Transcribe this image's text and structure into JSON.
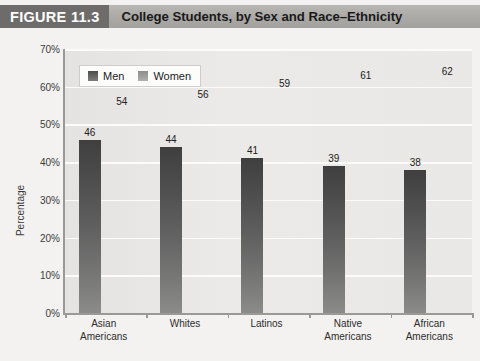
{
  "figure": {
    "number_label": "FIGURE 11.3",
    "title": "College Students, by Sex and Race–Ethnicity"
  },
  "legend": {
    "position": "top-left-inside",
    "entries": [
      {
        "label": "Men",
        "swatch": "men-swatch",
        "color": "#5e5e5e"
      },
      {
        "label": "Women",
        "swatch": "women-swatch",
        "color": "#9a9a97"
      }
    ]
  },
  "axes": {
    "ylabel": "Percentage",
    "yticks": [
      "0%",
      "10%",
      "20%",
      "30%",
      "40%",
      "50%",
      "60%",
      "70%"
    ],
    "ymin": 0,
    "ymax": 70,
    "ystep": 10,
    "xlabel": ""
  },
  "colors": {
    "title_block": "#6e6c6a",
    "title_band": "#aba9a6",
    "page_background": "#f3f2f0",
    "plot_background": "#e8e7e5",
    "gridline": "#fbfbfa",
    "axis_line": "#9b9996",
    "men_bar": "#5e5e5e",
    "women_bar": "#9a9a97"
  },
  "chart_data": {
    "type": "bar",
    "title": "College Students, by Sex and Race–Ethnicity",
    "xlabel": "",
    "ylabel": "Percentage",
    "ylim": [
      0,
      70
    ],
    "ytick_step": 10,
    "grid": true,
    "legend_position": "upper left",
    "categories": [
      "Asian\nAmericans",
      "Whites",
      "Latinos",
      "Native\nAmericans",
      "African\nAmericans"
    ],
    "category_lines": [
      [
        "Asian",
        "Americans"
      ],
      [
        "Whites"
      ],
      [
        "Latinos"
      ],
      [
        "Native",
        "Americans"
      ],
      [
        "African",
        "Americans"
      ]
    ],
    "series": [
      {
        "name": "Men",
        "values": [
          46,
          44,
          41,
          39,
          38
        ]
      },
      {
        "name": "Women",
        "values": [
          54,
          56,
          59,
          61,
          62
        ]
      }
    ]
  }
}
